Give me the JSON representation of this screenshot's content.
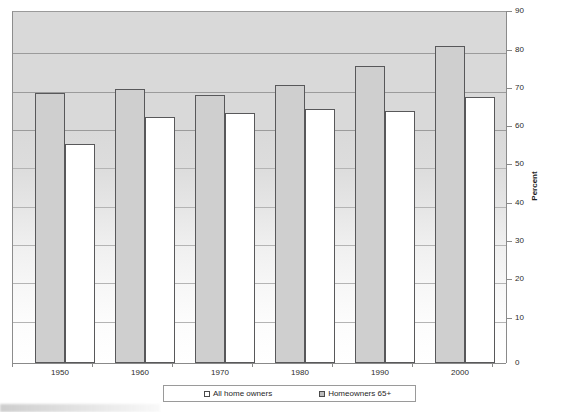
{
  "chart_data": {
    "type": "bar",
    "title": "",
    "xlabel": "",
    "ylabel": "Percent",
    "ylim": [
      0,
      90
    ],
    "y_ticks": [
      0,
      10,
      20,
      30,
      40,
      50,
      60,
      70,
      80,
      90
    ],
    "grid": true,
    "legend_position": "bottom",
    "categories": [
      "1950",
      "1960",
      "1970",
      "1980",
      "1990",
      "2000"
    ],
    "series": [
      {
        "name": "All home owners",
        "color": "#cfcfcf",
        "values": [
          69,
          70,
          68.5,
          71,
          76,
          81
        ]
      },
      {
        "name": "Homeowners 65+",
        "color": "#ffffff",
        "values": [
          56,
          63,
          64,
          65,
          64.5,
          68
        ]
      }
    ]
  },
  "axis": {
    "y_title": "Percent",
    "y_tick_labels": [
      "90",
      "80",
      "70",
      "60",
      "50",
      "40",
      "30",
      "20",
      "10",
      "0"
    ],
    "x_tick_labels": [
      "1950",
      "1960",
      "1970",
      "1980",
      "1990",
      "2000"
    ]
  },
  "legend": {
    "entries": [
      {
        "label": "All home owners",
        "swatch": "white-square"
      },
      {
        "label": "Homeowners 65+",
        "swatch": "gray-square"
      }
    ]
  }
}
